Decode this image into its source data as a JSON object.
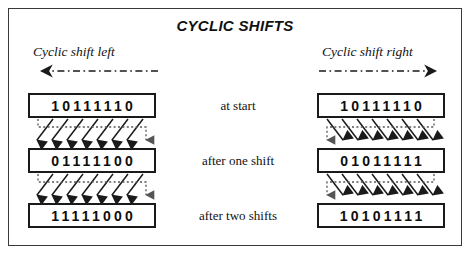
{
  "figure": {
    "title": "CYCLIC SHIFTS",
    "border_color": "#3a3a3a",
    "background_color": "#ffffff",
    "box_border_color": "#1a1a1a",
    "arrow_color": "#1a1a1a",
    "dotted_arrow_color": "#555555"
  },
  "stages": [
    {
      "label": "at start"
    },
    {
      "label": "after one shift"
    },
    {
      "label": "after two shifts"
    }
  ],
  "columns": {
    "left": {
      "heading": "Cyclic shift left",
      "direction": "left",
      "rows": [
        {
          "bits": "10111110"
        },
        {
          "bits": "01111100"
        },
        {
          "bits": "11111000"
        }
      ]
    },
    "right": {
      "heading": "Cyclic shift right",
      "direction": "right",
      "rows": [
        {
          "bits": "10111110"
        },
        {
          "bits": "01011111"
        },
        {
          "bits": "10101111"
        }
      ]
    }
  }
}
